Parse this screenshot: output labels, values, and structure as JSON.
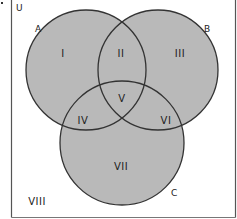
{
  "diagram": {
    "type": "venn",
    "universe_label": "U",
    "sets": [
      {
        "label": "A",
        "cx": 86,
        "cy": 70,
        "r": 60
      },
      {
        "label": "B",
        "cx": 158,
        "cy": 70,
        "r": 60
      },
      {
        "label": "C",
        "cx": 122,
        "cy": 143,
        "r": 62
      }
    ],
    "regions": [
      {
        "label": "I",
        "x": 63,
        "y": 57
      },
      {
        "label": "II",
        "x": 121,
        "y": 57
      },
      {
        "label": "III",
        "x": 180,
        "y": 57
      },
      {
        "label": "V",
        "x": 122,
        "y": 102
      },
      {
        "label": "IV",
        "x": 83,
        "y": 124
      },
      {
        "label": "VI",
        "x": 166,
        "y": 124
      },
      {
        "label": "VII",
        "x": 121,
        "y": 170
      },
      {
        "label": "VIII",
        "x": 37,
        "y": 205
      }
    ],
    "colors": {
      "fill": "#b9b9b9",
      "stroke": "#333333",
      "border": "#555555"
    }
  }
}
